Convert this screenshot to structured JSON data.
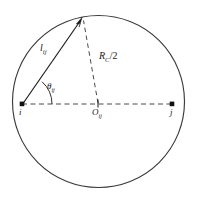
{
  "figure": {
    "type": "geometry-diagram",
    "canvas": {
      "width": 199,
      "height": 208,
      "background": "#ffffff"
    },
    "colors": {
      "stroke": "#1a1a1a",
      "circle_stroke": "#3a3a3a",
      "dash_stroke": "#4a4a4a",
      "label_text": "#1a1a1a",
      "background": "#ffffff"
    },
    "circle": {
      "center_x": 98.5,
      "center_y": 101.5,
      "radius": 86,
      "stroke_width": 1.1,
      "style": "solid"
    },
    "points": [
      {
        "id": "i",
        "label": "i",
        "x": 22,
        "y": 104,
        "marker": "square-dot"
      },
      {
        "id": "j",
        "label": "j",
        "x": 172,
        "y": 104,
        "marker": "square-dot"
      },
      {
        "id": "O_ij",
        "label": "O",
        "sub": "ij",
        "x": 98,
        "y": 104,
        "marker": "tick"
      },
      {
        "id": "apex",
        "label": "",
        "x": 82,
        "y": 18,
        "marker": "arrowhead"
      }
    ],
    "segments": [
      {
        "id": "chord-i-apex",
        "from": "i",
        "to": "apex",
        "style": "solid",
        "arrow": true,
        "label_id": "l"
      },
      {
        "id": "radius-o-apex",
        "from": "O_ij",
        "to": "apex",
        "style": "dashed",
        "arrow": false,
        "label_id": "rc"
      },
      {
        "id": "diameter-i-j",
        "from": "i",
        "to": "j",
        "style": "dashed",
        "arrow": false,
        "label_id": null
      }
    ],
    "angle_arc": {
      "vertex": "i",
      "radius": 30,
      "from_deg": 0,
      "to_deg": 48,
      "style": "solid"
    },
    "labels": {
      "chord_length": {
        "base": "l",
        "sub": "ij",
        "text": "l",
        "x": 41,
        "y": 48
      },
      "radius_half": {
        "base": "R",
        "sub": "C",
        "suffix": "/2",
        "text": "R",
        "x": 100,
        "y": 57
      },
      "angle": {
        "base": "θ",
        "sub": "ij",
        "text": "θ",
        "x": 48,
        "y": 87
      },
      "node_i": {
        "base": "i",
        "sub": "",
        "text": "i",
        "x": 20,
        "y": 112
      },
      "node_j": {
        "base": "j",
        "sub": "",
        "text": "j",
        "x": 170,
        "y": 112
      },
      "node_o": {
        "base": "O",
        "sub": "ij",
        "text": "O",
        "x": 92,
        "y": 113
      }
    },
    "label_text": {
      "chord_length_base": "l",
      "chord_length_sub": "ij",
      "radius_base": "R",
      "radius_sub": "C",
      "radius_suffix": "/2",
      "angle_base": "θ",
      "angle_sub": "ij",
      "node_i": "i",
      "node_j": "j",
      "node_o_base": "O",
      "node_o_sub": "ij"
    }
  }
}
